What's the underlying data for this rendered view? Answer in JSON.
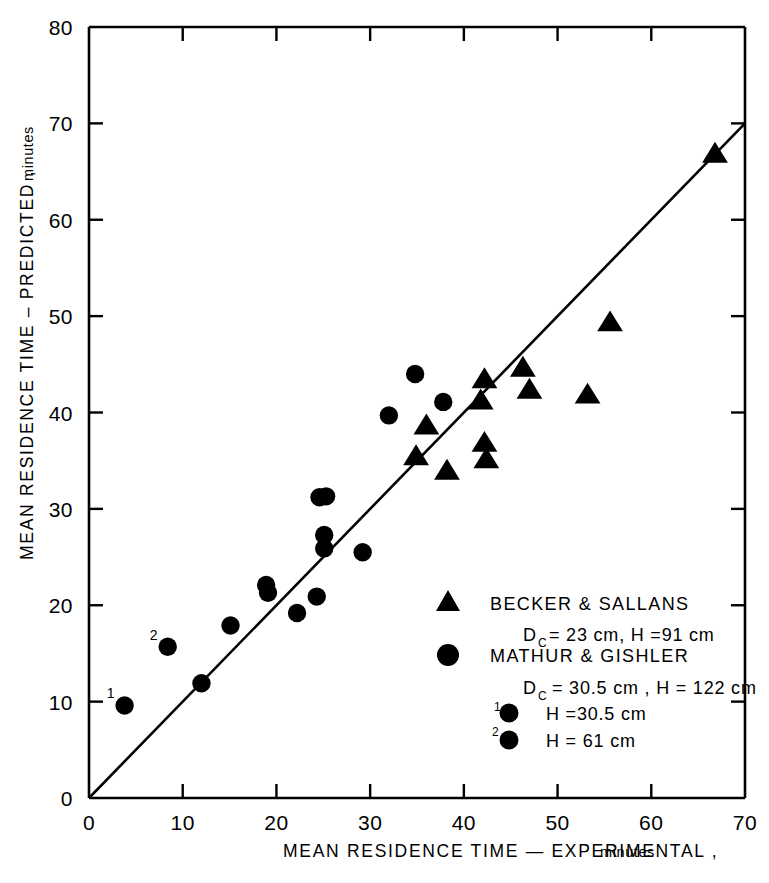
{
  "chart_data": {
    "type": "scatter",
    "title": "",
    "xlabel": "MEAN  RESIDENCE  TIME — EXPERIMENTAL ,",
    "xlabel_units": "minutes",
    "ylabel": "MEAN  RESIDENCE  TIME  –  PREDICTED ,",
    "ylabel_units": "minutes",
    "xlim": [
      0,
      70
    ],
    "ylim": [
      0,
      80
    ],
    "xticks": [
      0,
      10,
      20,
      30,
      40,
      50,
      60,
      70
    ],
    "xtick_labels": [
      "0",
      "10",
      "20",
      "30",
      "40",
      "50",
      "60",
      "70"
    ],
    "yticks": [
      0,
      10,
      20,
      30,
      40,
      50,
      60,
      70,
      80
    ],
    "ytick_labels": [
      "0",
      "10",
      "20",
      "30",
      "40",
      "50",
      "60",
      "70",
      "80"
    ],
    "grid": false,
    "legend_position": "lower-right-inside",
    "reference_line": {
      "name": "parity-line",
      "label": "y = x",
      "from": [
        0,
        0
      ],
      "to": [
        70,
        70
      ]
    },
    "series": [
      {
        "name": "BECKER & SALLANS",
        "marker": "triangle",
        "color": "#000000",
        "points": [
          [
            34.9,
            35.5
          ],
          [
            36.0,
            38.7
          ],
          [
            38.2,
            34.0
          ],
          [
            41.8,
            41.3
          ],
          [
            42.2,
            43.5
          ],
          [
            42.2,
            36.9
          ],
          [
            42.4,
            35.2
          ],
          [
            46.3,
            44.7
          ],
          [
            47.0,
            42.4
          ],
          [
            53.2,
            41.9
          ],
          [
            55.6,
            49.4
          ],
          [
            66.8,
            66.9
          ]
        ]
      },
      {
        "name": "MATHUR & GISHLER",
        "marker": "circle",
        "color": "#000000",
        "points": [
          [
            12.0,
            11.9
          ],
          [
            15.1,
            17.9
          ],
          [
            18.9,
            22.1
          ],
          [
            19.1,
            21.3
          ],
          [
            22.2,
            19.2
          ],
          [
            24.3,
            20.9
          ],
          [
            24.6,
            31.2
          ],
          [
            25.3,
            31.3
          ],
          [
            25.1,
            27.3
          ],
          [
            25.1,
            25.9
          ],
          [
            29.2,
            25.5
          ],
          [
            32.0,
            39.7
          ],
          [
            34.8,
            44.0
          ],
          [
            37.8,
            41.1
          ]
        ]
      },
      {
        "name": "H = 30.5 cm",
        "marker": "circle-labeled-1",
        "color": "#000000",
        "points": [
          [
            3.8,
            9.6
          ]
        ]
      },
      {
        "name": "H = 61 cm",
        "marker": "circle-labeled-2",
        "color": "#000000",
        "points": [
          [
            8.4,
            15.7
          ]
        ]
      }
    ]
  },
  "legend": {
    "entries": [
      {
        "marker": "triangle",
        "title": "BECKER  &  SALLANS",
        "detail_prefix": "D",
        "detail_sub": "C",
        "detail": " = 23 cm,  H =91 cm"
      },
      {
        "marker": "circle",
        "title": "MATHUR  &  GISHLER",
        "detail_prefix": "D",
        "detail_sub": "C",
        "detail": " = 30.5 cm ,  H = 122 cm"
      }
    ],
    "sub_entries": [
      {
        "superscript": "1",
        "marker": "circle",
        "label": "H =30.5 cm"
      },
      {
        "superscript": "2",
        "marker": "circle",
        "label": "H = 61  cm"
      }
    ]
  },
  "colors": {
    "axis": "#000000",
    "marker": "#000000",
    "background": "#ffffff"
  }
}
